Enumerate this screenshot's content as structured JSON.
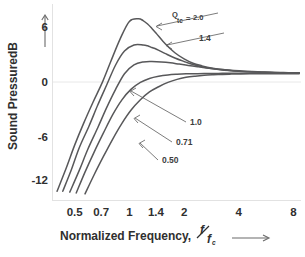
{
  "chart_data": {
    "type": "line",
    "title": "",
    "subtitle": "",
    "xlabel": "Normalized Frequency,",
    "xlabel_symbol_num": "f",
    "xlabel_symbol_den": "f",
    "xlabel_symbol_den_sub": "c",
    "ylabel": "Sound Pressure",
    "ylabel_unit": "dB",
    "xscale": "log",
    "xlim": [
      0.38,
      8.8
    ],
    "ylim": [
      -14.5,
      8.0
    ],
    "xticks": [
      "0.5",
      "0.7",
      "1",
      "1.4",
      "2",
      "4",
      "8"
    ],
    "xtick_values": [
      0.5,
      0.7,
      1,
      1.4,
      2,
      4,
      8
    ],
    "yticks": [
      "6",
      "0",
      "-6",
      "-12"
    ],
    "ytick_values": [
      6,
      0,
      -6,
      -12
    ],
    "grid": false,
    "legend_position": "inline-annotations",
    "series_param_name": "Q",
    "series_param_sub": "tc",
    "series_param_eq": "=",
    "series": [
      {
        "name": "2.0",
        "label": "2.0",
        "q": 2.0,
        "x": [
          0.4,
          0.45,
          0.5,
          0.56,
          0.63,
          0.71,
          0.79,
          0.89,
          1.0,
          1.12,
          1.19,
          1.26,
          1.33,
          1.41,
          1.58,
          1.78,
          2.0,
          2.24,
          2.51,
          2.82,
          3.16,
          3.55,
          4.0,
          4.5,
          5.0,
          5.66,
          6.35,
          7.13,
          8.0,
          8.6
        ],
        "y": [
          -13.5,
          -10.8,
          -8.2,
          -5.7,
          -3.3,
          -1.0,
          1.4,
          4.0,
          6.0,
          6.3,
          6.1,
          5.7,
          5.2,
          4.6,
          3.4,
          2.4,
          1.7,
          1.2,
          0.9,
          0.65,
          0.5,
          0.38,
          0.3,
          0.24,
          0.2,
          0.16,
          0.13,
          0.11,
          0.1,
          0.1
        ]
      },
      {
        "name": "1.4",
        "label": "1.4",
        "q": 1.4,
        "x": [
          0.43,
          0.48,
          0.53,
          0.6,
          0.67,
          0.75,
          0.84,
          0.94,
          1.06,
          1.19,
          1.26,
          1.33,
          1.41,
          1.58,
          1.78,
          2.0,
          2.24,
          2.51,
          2.82,
          3.16,
          3.55,
          4.0,
          4.5,
          5.0,
          5.66,
          6.35,
          7.13,
          8.0,
          8.6
        ],
        "y": [
          -13.5,
          -11.0,
          -8.5,
          -6.0,
          -3.6,
          -1.3,
          1.0,
          2.6,
          3.3,
          3.3,
          3.2,
          3.0,
          2.8,
          2.3,
          1.8,
          1.4,
          1.05,
          0.8,
          0.6,
          0.46,
          0.36,
          0.28,
          0.22,
          0.18,
          0.15,
          0.12,
          0.1,
          0.09,
          0.09
        ]
      },
      {
        "name": "1.0",
        "label": "1.0",
        "q": 1.0,
        "x": [
          0.47,
          0.53,
          0.59,
          0.67,
          0.75,
          0.84,
          0.94,
          1.06,
          1.19,
          1.33,
          1.5,
          1.68,
          1.88,
          2.11,
          2.37,
          2.66,
          2.99,
          3.35,
          3.76,
          4.22,
          4.73,
          5.31,
          5.96,
          6.68,
          7.5,
          8.4,
          8.6
        ],
        "y": [
          -13.6,
          -11.1,
          -8.7,
          -6.2,
          -3.9,
          -1.8,
          0.0,
          1.0,
          1.35,
          1.4,
          1.35,
          1.25,
          1.1,
          0.95,
          0.8,
          0.66,
          0.54,
          0.44,
          0.36,
          0.29,
          0.24,
          0.2,
          0.16,
          0.14,
          0.11,
          0.1,
          0.1
        ]
      },
      {
        "name": "0.71",
        "label": "0.71",
        "q": 0.71,
        "x": [
          0.51,
          0.57,
          0.64,
          0.72,
          0.81,
          0.91,
          1.02,
          1.15,
          1.29,
          1.45,
          1.63,
          1.83,
          2.05,
          2.3,
          2.58,
          2.9,
          3.25,
          3.65,
          4.1,
          4.6,
          5.16,
          5.79,
          6.5,
          7.29,
          8.18,
          8.6
        ],
        "y": [
          -13.7,
          -11.3,
          -9.0,
          -6.8,
          -4.7,
          -3.0,
          -1.8,
          -1.0,
          -0.55,
          -0.3,
          -0.15,
          -0.07,
          -0.02,
          0.0,
          0.02,
          0.03,
          0.04,
          0.04,
          0.05,
          0.05,
          0.05,
          0.05,
          0.05,
          0.05,
          0.05,
          0.05
        ]
      },
      {
        "name": "0.50",
        "label": "0.50",
        "q": 0.5,
        "x": [
          0.57,
          0.64,
          0.72,
          0.81,
          0.91,
          1.02,
          1.15,
          1.29,
          1.45,
          1.63,
          1.83,
          2.05,
          2.3,
          2.58,
          2.9,
          3.25,
          3.65,
          4.1,
          4.6,
          5.16,
          5.79,
          6.5,
          7.29,
          8.18,
          8.6
        ],
        "y": [
          -13.8,
          -11.6,
          -9.5,
          -7.5,
          -5.7,
          -4.2,
          -3.0,
          -2.1,
          -1.5,
          -1.0,
          -0.65,
          -0.42,
          -0.28,
          -0.18,
          -0.12,
          -0.08,
          -0.05,
          -0.03,
          -0.02,
          -0.01,
          0.0,
          0.0,
          0.0,
          0.0,
          0.0
        ]
      }
    ],
    "annotations": [
      {
        "text": "2.0",
        "target_series": "2.0"
      },
      {
        "text": "1.4",
        "target_series": "1.4"
      },
      {
        "text": "1.0",
        "target_series": "1.0"
      },
      {
        "text": "0.71",
        "target_series": "0.71"
      },
      {
        "text": "0.50",
        "target_series": "0.50"
      }
    ],
    "colors": {
      "curve": "#58585a",
      "text": "#2f2f2f",
      "background": "#ffffff",
      "frame": "#e2e2e2"
    }
  }
}
